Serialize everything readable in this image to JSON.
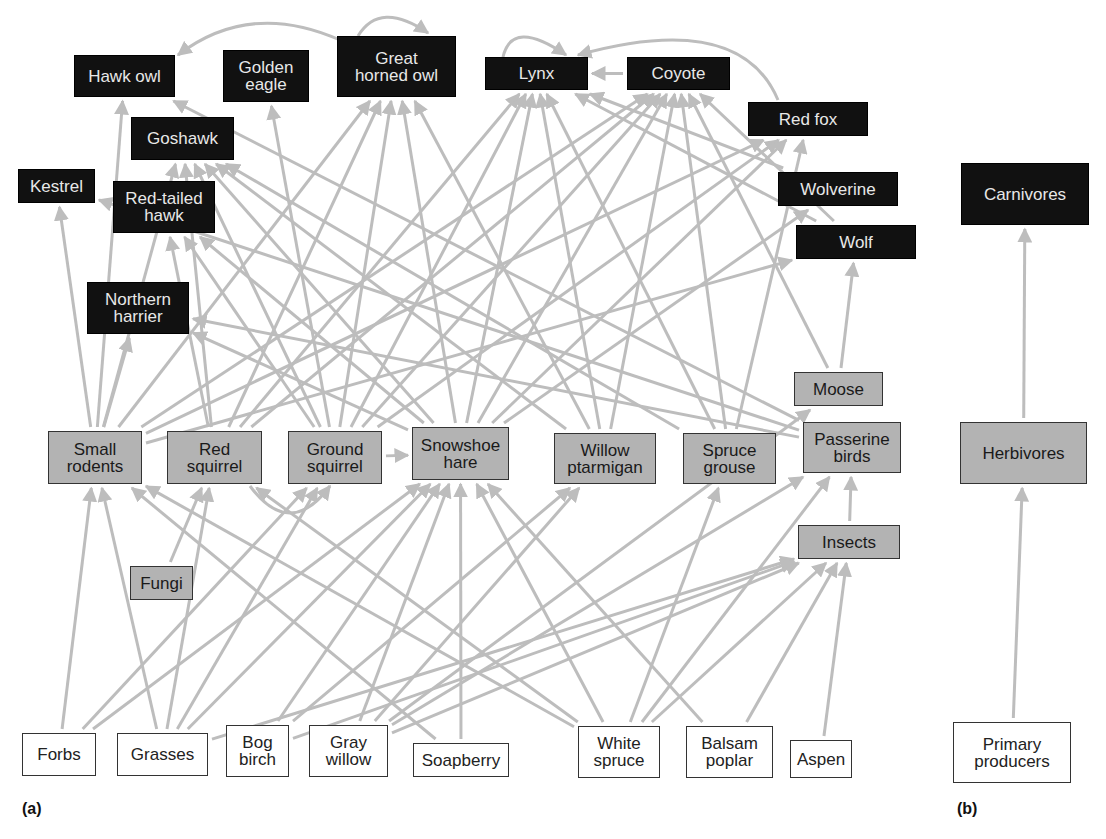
{
  "panels": {
    "a": {
      "label": "(a)"
    },
    "b": {
      "label": "(b)"
    }
  },
  "colors": {
    "carnivore_fill": "#111111",
    "herbivore_fill": "#b3b3b3",
    "producer_fill": "#ffffff",
    "edge": "#bdbdbd"
  },
  "nodes": {
    "hawk_owl": {
      "label": "Hawk owl",
      "type": "carnivore",
      "x": 74,
      "y": 55,
      "w": 101,
      "h": 42
    },
    "golden_eagle": {
      "label": "Golden\neagle",
      "type": "carnivore",
      "x": 223,
      "y": 50,
      "w": 86,
      "h": 52
    },
    "great_horned_owl": {
      "label": "Great\nhorned owl",
      "type": "carnivore",
      "x": 337,
      "y": 36,
      "w": 119,
      "h": 61
    },
    "lynx": {
      "label": "Lynx",
      "type": "carnivore",
      "x": 485,
      "y": 57,
      "w": 103,
      "h": 33
    },
    "coyote": {
      "label": "Coyote",
      "type": "carnivore",
      "x": 627,
      "y": 57,
      "w": 103,
      "h": 33
    },
    "red_fox": {
      "label": "Red fox",
      "type": "carnivore",
      "x": 748,
      "y": 102,
      "w": 120,
      "h": 34
    },
    "goshawk": {
      "label": "Goshawk",
      "type": "carnivore",
      "x": 131,
      "y": 117,
      "w": 103,
      "h": 43
    },
    "kestrel": {
      "label": "Kestrel",
      "type": "carnivore",
      "x": 18,
      "y": 169,
      "w": 77,
      "h": 34
    },
    "red_tailed_hawk": {
      "label": "Red-tailed\nhawk",
      "type": "carnivore",
      "x": 113,
      "y": 181,
      "w": 102,
      "h": 52
    },
    "wolverine": {
      "label": "Wolverine",
      "type": "carnivore",
      "x": 778,
      "y": 172,
      "w": 120,
      "h": 34
    },
    "wolf": {
      "label": "Wolf",
      "type": "carnivore",
      "x": 796,
      "y": 225,
      "w": 120,
      "h": 34
    },
    "northern_harrier": {
      "label": "Northern\nharrier",
      "type": "carnivore",
      "x": 87,
      "y": 282,
      "w": 102,
      "h": 52
    },
    "moose": {
      "label": "Moose",
      "type": "herbivore",
      "x": 794,
      "y": 372,
      "w": 89,
      "h": 34
    },
    "small_rodents": {
      "label": "Small\nrodents",
      "type": "herbivore",
      "x": 48,
      "y": 431,
      "w": 94,
      "h": 53
    },
    "red_squirrel": {
      "label": "Red\nsquirrel",
      "type": "herbivore",
      "x": 167,
      "y": 431,
      "w": 95,
      "h": 53
    },
    "ground_squirrel": {
      "label": "Ground\nsquirrel",
      "type": "herbivore",
      "x": 288,
      "y": 431,
      "w": 94,
      "h": 53
    },
    "snowshoe_hare": {
      "label": "Snowshoe\nhare",
      "type": "herbivore",
      "x": 412,
      "y": 427,
      "w": 97,
      "h": 53
    },
    "willow_ptarmigan": {
      "label": "Willow\nptarmigan",
      "type": "herbivore",
      "x": 554,
      "y": 433,
      "w": 102,
      "h": 51
    },
    "spruce_grouse": {
      "label": "Spruce\ngrouse",
      "type": "herbivore",
      "x": 683,
      "y": 433,
      "w": 93,
      "h": 51
    },
    "passerine_birds": {
      "label": "Passerine\nbirds",
      "type": "herbivore",
      "x": 803,
      "y": 422,
      "w": 98,
      "h": 51
    },
    "insects": {
      "label": "Insects",
      "type": "herbivore",
      "x": 798,
      "y": 525,
      "w": 102,
      "h": 34
    },
    "fungi": {
      "label": "Fungi",
      "type": "herbivore",
      "x": 130,
      "y": 566,
      "w": 63,
      "h": 34
    },
    "forbs": {
      "label": "Forbs",
      "type": "producer",
      "x": 22,
      "y": 733,
      "w": 74,
      "h": 43
    },
    "grasses": {
      "label": "Grasses",
      "type": "producer",
      "x": 117,
      "y": 733,
      "w": 91,
      "h": 43
    },
    "bog_birch": {
      "label": "Bog\nbirch",
      "type": "producer",
      "x": 226,
      "y": 725,
      "w": 63,
      "h": 52
    },
    "gray_willow": {
      "label": "Gray\nwillow",
      "type": "producer",
      "x": 309,
      "y": 725,
      "w": 79,
      "h": 52
    },
    "soapberry": {
      "label": "Soapberry",
      "type": "producer",
      "x": 413,
      "y": 743,
      "w": 96,
      "h": 34
    },
    "white_spruce": {
      "label": "White\nspruce",
      "type": "producer",
      "x": 578,
      "y": 726,
      "w": 82,
      "h": 52
    },
    "balsam_poplar": {
      "label": "Balsam\npoplar",
      "type": "producer",
      "x": 686,
      "y": 726,
      "w": 87,
      "h": 52
    },
    "aspen": {
      "label": "Aspen",
      "type": "producer",
      "x": 790,
      "y": 740,
      "w": 62,
      "h": 38
    },
    "carnivores": {
      "label": "Carnivores",
      "type": "carnivore",
      "x": 961,
      "y": 163,
      "w": 128,
      "h": 62
    },
    "herbivores": {
      "label": "Herbivores",
      "type": "herbivore",
      "x": 960,
      "y": 422,
      "w": 127,
      "h": 62
    },
    "primary_producers": {
      "label": "Primary\nproducers",
      "type": "producer",
      "x": 953,
      "y": 722,
      "w": 118,
      "h": 61
    }
  },
  "edges": [
    [
      "forbs",
      "small_rodents"
    ],
    [
      "forbs",
      "ground_squirrel"
    ],
    [
      "forbs",
      "snowshoe_hare"
    ],
    [
      "grasses",
      "small_rodents"
    ],
    [
      "grasses",
      "red_squirrel"
    ],
    [
      "grasses",
      "ground_squirrel"
    ],
    [
      "grasses",
      "snowshoe_hare"
    ],
    [
      "grasses",
      "insects"
    ],
    [
      "bog_birch",
      "snowshoe_hare"
    ],
    [
      "bog_birch",
      "willow_ptarmigan"
    ],
    [
      "bog_birch",
      "insects"
    ],
    [
      "gray_willow",
      "snowshoe_hare"
    ],
    [
      "gray_willow",
      "willow_ptarmigan"
    ],
    [
      "gray_willow",
      "moose"
    ],
    [
      "gray_willow",
      "insects"
    ],
    [
      "gray_willow",
      "passerine_birds"
    ],
    [
      "soapberry",
      "snowshoe_hare"
    ],
    [
      "soapberry",
      "small_rodents"
    ],
    [
      "white_spruce",
      "red_squirrel"
    ],
    [
      "white_spruce",
      "snowshoe_hare"
    ],
    [
      "white_spruce",
      "spruce_grouse"
    ],
    [
      "white_spruce",
      "insects"
    ],
    [
      "white_spruce",
      "passerine_birds"
    ],
    [
      "white_spruce",
      "small_rodents"
    ],
    [
      "balsam_poplar",
      "insects"
    ],
    [
      "balsam_poplar",
      "snowshoe_hare"
    ],
    [
      "aspen",
      "insects"
    ],
    [
      "fungi",
      "red_squirrel"
    ],
    [
      "insects",
      "passerine_birds"
    ],
    [
      "small_rodents",
      "kestrel"
    ],
    [
      "small_rodents",
      "hawk_owl"
    ],
    [
      "small_rodents",
      "northern_harrier"
    ],
    [
      "small_rodents",
      "great_horned_owl"
    ],
    [
      "small_rodents",
      "red_fox"
    ],
    [
      "small_rodents",
      "wolf"
    ],
    [
      "small_rodents",
      "coyote"
    ],
    [
      "small_rodents",
      "goshawk"
    ],
    [
      "red_squirrel",
      "red_tailed_hawk"
    ],
    [
      "red_squirrel",
      "goshawk"
    ],
    [
      "red_squirrel",
      "great_horned_owl"
    ],
    [
      "red_squirrel",
      "lynx"
    ],
    [
      "red_squirrel",
      "coyote"
    ],
    [
      "ground_squirrel",
      "golden_eagle"
    ],
    [
      "ground_squirrel",
      "goshawk"
    ],
    [
      "ground_squirrel",
      "red_tailed_hawk"
    ],
    [
      "ground_squirrel",
      "great_horned_owl"
    ],
    [
      "ground_squirrel",
      "lynx"
    ],
    [
      "ground_squirrel",
      "coyote"
    ],
    [
      "ground_squirrel",
      "red_fox"
    ],
    [
      "ground_squirrel",
      "snowshoe_hare"
    ],
    [
      "snowshoe_hare",
      "goshawk"
    ],
    [
      "snowshoe_hare",
      "great_horned_owl"
    ],
    [
      "snowshoe_hare",
      "lynx"
    ],
    [
      "snowshoe_hare",
      "coyote"
    ],
    [
      "snowshoe_hare",
      "red_fox"
    ],
    [
      "snowshoe_hare",
      "wolverine"
    ],
    [
      "snowshoe_hare",
      "northern_harrier"
    ],
    [
      "snowshoe_hare",
      "red_tailed_hawk"
    ],
    [
      "willow_ptarmigan",
      "goshawk"
    ],
    [
      "willow_ptarmigan",
      "great_horned_owl"
    ],
    [
      "willow_ptarmigan",
      "lynx"
    ],
    [
      "willow_ptarmigan",
      "coyote"
    ],
    [
      "spruce_grouse",
      "goshawk"
    ],
    [
      "spruce_grouse",
      "lynx"
    ],
    [
      "spruce_grouse",
      "coyote"
    ],
    [
      "spruce_grouse",
      "red_fox"
    ],
    [
      "passerine_birds",
      "kestrel"
    ],
    [
      "passerine_birds",
      "northern_harrier"
    ],
    [
      "passerine_birds",
      "hawk_owl"
    ],
    [
      "moose",
      "wolf"
    ],
    [
      "moose",
      "coyote"
    ],
    [
      "wolverine",
      "lynx"
    ],
    [
      "wolf",
      "lynx"
    ],
    [
      "wolf",
      "coyote"
    ],
    [
      "coyote",
      "lynx"
    ],
    [
      "herbivores",
      "carnivores"
    ],
    [
      "primary_producers",
      "herbivores"
    ]
  ],
  "curved_edges": [
    {
      "from": "great_horned_owl",
      "to": "hawk_owl",
      "path": "M 340 40 Q 250 0 178 55"
    },
    {
      "from": "great_horned_owl",
      "to": "great_horned_owl",
      "path": "M 358 36 Q 380 0 428 33"
    },
    {
      "from": "lynx",
      "to": "lynx",
      "path": "M 503 57 Q 512 18 566 55"
    },
    {
      "from": "red_fox",
      "to": "lynx",
      "path": "M 778 100 Q 740 10 578 55"
    },
    {
      "from": "red_squirrel",
      "to": "ground_squirrel",
      "path": "M 250 486 Q 290 540 330 486"
    }
  ]
}
